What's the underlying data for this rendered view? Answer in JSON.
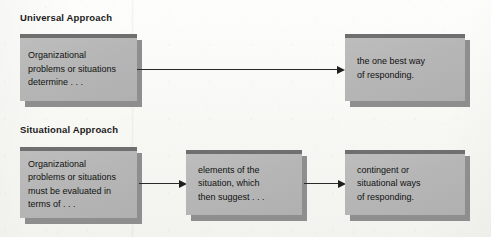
{
  "figure": {
    "background_color": "#fbfbf9",
    "box_fill_color": "#b6b6b6",
    "box_topbar_color": "#6f6f6f",
    "box_shadow_color": "#8e8e8e",
    "arrow_color": "#2a2a2a"
  },
  "sections": [
    {
      "heading": "Universal Approach",
      "nodes": [
        {
          "text": "Organizational\nproblems or situations\ndetermine . . ."
        },
        {
          "text": "the one best way\nof responding."
        }
      ]
    },
    {
      "heading": "Situational Approach",
      "nodes": [
        {
          "text": "Organizational\nproblems or situations\nmust be evaluated in\nterms of . . ."
        },
        {
          "text": "elements of the\nsituation, which\nthen suggest . . ."
        },
        {
          "text": "contingent or\nsituational ways\nof responding."
        }
      ]
    }
  ]
}
